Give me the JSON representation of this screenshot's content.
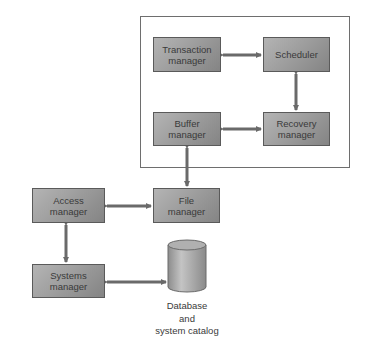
{
  "diagram": {
    "container": "dbms-core",
    "nodes": [
      {
        "id": "transaction",
        "lines": [
          "Transaction",
          "manager"
        ]
      },
      {
        "id": "scheduler",
        "lines": [
          "Scheduler"
        ]
      },
      {
        "id": "buffer",
        "lines": [
          "Buffer",
          "manager"
        ]
      },
      {
        "id": "recovery",
        "lines": [
          "Recovery",
          "manager"
        ]
      },
      {
        "id": "access",
        "lines": [
          "Access",
          "manager"
        ]
      },
      {
        "id": "file",
        "lines": [
          "File",
          "manager"
        ]
      },
      {
        "id": "systems",
        "lines": [
          "Systems",
          "manager"
        ]
      }
    ],
    "database": {
      "lines": [
        "Database",
        "and",
        "system catalog"
      ]
    },
    "edges": [
      [
        "transaction",
        "scheduler"
      ],
      [
        "scheduler",
        "recovery"
      ],
      [
        "buffer",
        "recovery"
      ],
      [
        "buffer",
        "file"
      ],
      [
        "access",
        "file"
      ],
      [
        "access",
        "systems"
      ],
      [
        "systems",
        "database"
      ]
    ],
    "colors": {
      "box": "#9c9c9c",
      "arrow": "#6a6a6a",
      "border": "#6e6e6e"
    }
  }
}
